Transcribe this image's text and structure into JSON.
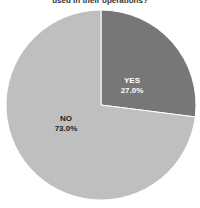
{
  "chart_data": {
    "type": "pie",
    "title": "used in their operations?",
    "categories": [
      "YES",
      "NO"
    ],
    "values": [
      27.0,
      73.0
    ],
    "labels": [
      "27.0%",
      "73.0%"
    ],
    "colors": [
      "#777777",
      "#bfbfbf"
    ],
    "legend": "none"
  },
  "labels": {
    "yes_name": "YES",
    "yes_pct": "27.0%",
    "no_name": "NO",
    "no_pct": "73.0%"
  }
}
